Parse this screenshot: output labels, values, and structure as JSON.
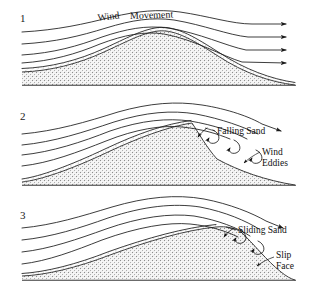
{
  "figure": {
    "background_color": "#ffffff",
    "ink_color": "#1a1a1a",
    "stipple_color": "#9a9a9a",
    "width": 312,
    "height": 299
  },
  "panels": [
    {
      "number": "1",
      "number_x": 20,
      "number_y": 22,
      "labels": [
        {
          "text": "Wind",
          "x": 98,
          "y": 21
        },
        {
          "text": "Movement",
          "x": 130,
          "y": 19
        }
      ]
    },
    {
      "number": "2",
      "number_x": 20,
      "number_y": 120,
      "labels": [
        {
          "text": "Falling Sand",
          "x": 217,
          "y": 134
        },
        {
          "text": "Wind",
          "x": 262,
          "y": 155
        },
        {
          "text": "Eddies",
          "x": 262,
          "y": 166
        }
      ]
    },
    {
      "number": "3",
      "number_x": 20,
      "number_y": 219,
      "labels": [
        {
          "text": "Sliding Sand",
          "x": 238,
          "y": 233
        },
        {
          "text": "Slip",
          "x": 276,
          "y": 258
        },
        {
          "text": "Face",
          "x": 276,
          "y": 269
        }
      ]
    }
  ],
  "icons": {
    "arrowhead": "arrow-right-icon",
    "eddy_spiral": "spiral-curl-icon"
  }
}
